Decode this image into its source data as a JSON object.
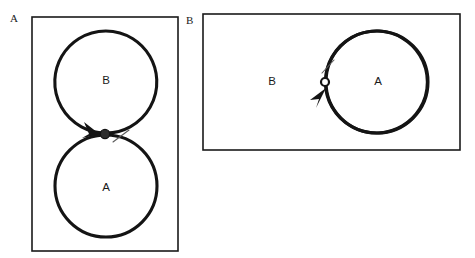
{
  "figure": {
    "background_color": "#ffffff",
    "stroke_color": "#141414",
    "frame_color": "#1a1a1a"
  },
  "panels": [
    {
      "tag": "A",
      "tag_position": {
        "x": 10,
        "y": 22
      },
      "frame": {
        "x": 32,
        "y": 17,
        "width": 146,
        "height": 234
      },
      "layout": "vertical-tangent-circles",
      "circles": [
        {
          "label": "B",
          "role": "upper",
          "cx": 106,
          "cy": 83,
          "r": 51,
          "label_x": 106,
          "label_y": 81
        },
        {
          "label": "A",
          "role": "lower",
          "cx": 106,
          "cy": 186,
          "r": 51,
          "label_x": 106,
          "label_y": 188
        }
      ],
      "junction": {
        "type": "filled-node",
        "fill": "#2e2e2e",
        "cx": 105,
        "cy": 134,
        "r": 4.6
      },
      "arrow": {
        "direction": "clockwise-into-junction",
        "description": "arrowhead on lower-left arc of upper circle pointing down-right toward junction",
        "tip_x": 99,
        "tip_y": 133
      },
      "tick": {
        "x1": 113,
        "y1": 142,
        "x2": 129,
        "y2": 130
      }
    },
    {
      "tag": "B",
      "tag_position": {
        "x": 186,
        "y": 24
      },
      "frame": {
        "x": 203,
        "y": 14,
        "width": 257,
        "height": 136
      },
      "layout": "horizontal-tangent-circles",
      "circles": [
        {
          "label": "B",
          "role": "left",
          "cx": 274,
          "cy": 82,
          "r": 51,
          "label_x": 272,
          "label_y": 82
        },
        {
          "label": "A",
          "role": "right",
          "cx": 377,
          "cy": 82,
          "r": 51,
          "label_x": 378,
          "label_y": 82
        }
      ],
      "junction": {
        "type": "hollow-node",
        "fill": "#ffffff",
        "cx": 325,
        "cy": 82,
        "r": 4.0
      },
      "arrow": {
        "direction": "counterclockwise-into-junction",
        "description": "arrowhead on lower-right arc of left circle pointing up-right toward junction",
        "tip_x": 325,
        "tip_y": 90
      },
      "tick": {
        "x1": 322,
        "y1": 73,
        "x2": 334,
        "y2": 60
      }
    }
  ]
}
